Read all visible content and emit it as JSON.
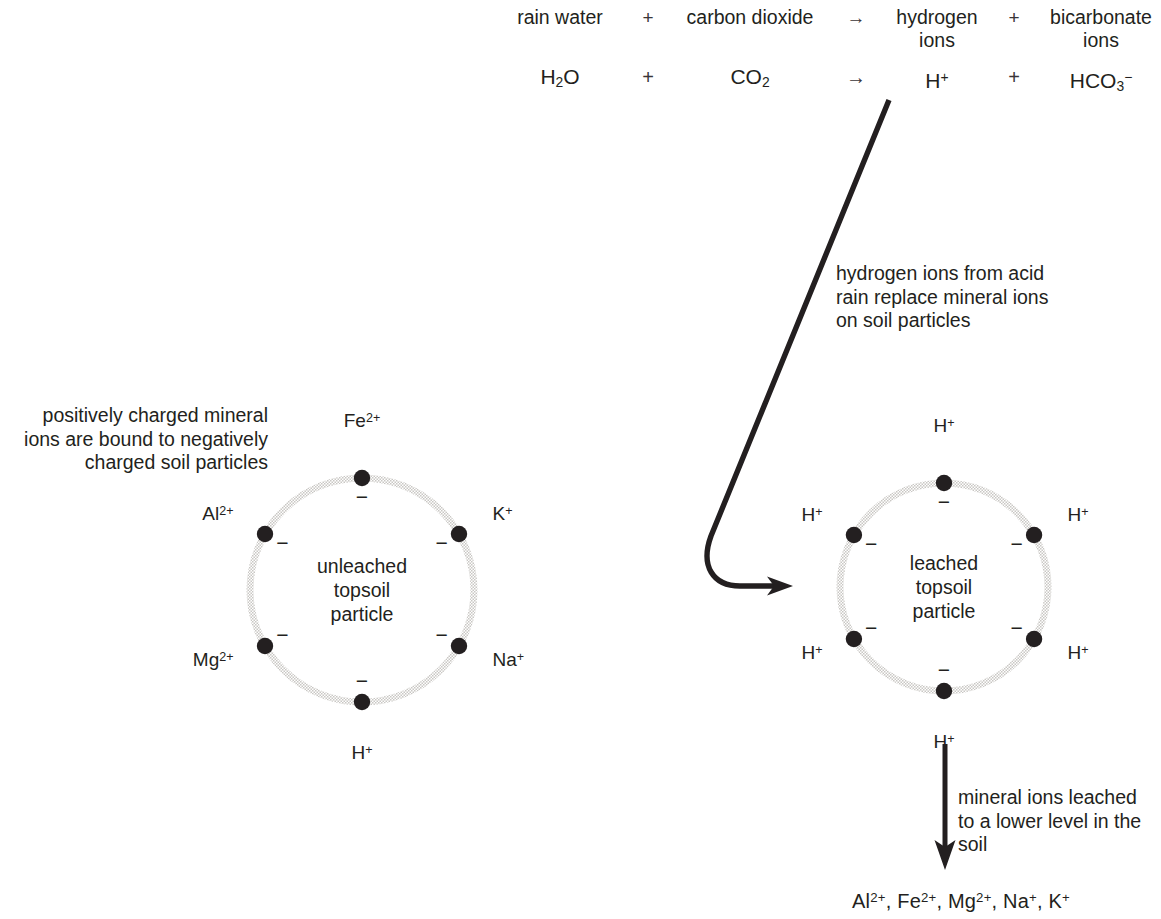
{
  "equation": {
    "word_row": {
      "reactant_1": "rain water",
      "operator_1": "+",
      "reactant_2": "carbon dioxide",
      "arrow": "→",
      "product_1": "hydrogen ions",
      "operator_2": "+",
      "product_2": "bicarbonate ions"
    },
    "symbol_row": {
      "reactant_1_formula": "H",
      "reactant_1_sub": "2",
      "reactant_1_tail": "O",
      "operator_1": "+",
      "reactant_2_formula": "CO",
      "reactant_2_sub": "2",
      "arrow": "→",
      "product_1_formula": "H",
      "product_1_sup": "+",
      "operator_2": "+",
      "product_2_formula": "HCO",
      "product_2_sub": "3",
      "product_2_sup": "−"
    }
  },
  "captions": {
    "left": "positively charged mineral ions are bound to negatively charged soil particles",
    "middle": "hydrogen ions from acid rain replace mineral ions on soil particles",
    "bottom": "mineral ions leached to a lower level in the soil"
  },
  "leached_ions": {
    "items": [
      {
        "element": "Al",
        "charge": "2+"
      },
      {
        "element": "Fe",
        "charge": "2+"
      },
      {
        "element": "Mg",
        "charge": "2+"
      },
      {
        "element": "Na",
        "charge": "+"
      },
      {
        "element": "K",
        "charge": "+"
      }
    ],
    "separator": ", "
  },
  "particles": [
    {
      "id": "unleached",
      "center_label_lines": [
        "unleached",
        "topsoil",
        "particle"
      ],
      "center_x": 362,
      "center_y": 590,
      "radius": 112,
      "ring_color": "#c9c7c4",
      "site_color": "#231f20",
      "sites": [
        {
          "name": "site-top",
          "angle": -90,
          "ion": "Fe",
          "charge": "2+",
          "site_charge": "−",
          "label_pos": "top"
        },
        {
          "name": "site-upper-left",
          "angle": -150,
          "ion": "Al",
          "charge": "2+",
          "site_charge": "−",
          "label_pos": "left"
        },
        {
          "name": "site-upper-right",
          "angle": -30,
          "ion": "K",
          "charge": "+",
          "site_charge": "−",
          "label_pos": "right"
        },
        {
          "name": "site-lower-left",
          "angle": 150,
          "ion": "Mg",
          "charge": "2+",
          "site_charge": "−",
          "label_pos": "left"
        },
        {
          "name": "site-lower-right",
          "angle": 30,
          "ion": "Na",
          "charge": "+",
          "site_charge": "−",
          "label_pos": "right"
        },
        {
          "name": "site-bottom",
          "angle": 90,
          "ion": "H",
          "charge": "+",
          "site_charge": "−",
          "label_pos": "bottom"
        }
      ]
    },
    {
      "id": "leached",
      "center_label_lines": [
        "leached",
        "topsoil",
        "particle"
      ],
      "center_x": 944,
      "center_y": 587,
      "radius": 104,
      "ring_color": "#c9c7c4",
      "site_color": "#231f20",
      "sites": [
        {
          "name": "site-top",
          "angle": -90,
          "ion": "H",
          "charge": "+",
          "site_charge": "−",
          "label_pos": "top"
        },
        {
          "name": "site-upper-left",
          "angle": -150,
          "ion": "H",
          "charge": "+",
          "site_charge": "−",
          "label_pos": "left"
        },
        {
          "name": "site-upper-right",
          "angle": -30,
          "ion": "H",
          "charge": "+",
          "site_charge": "−",
          "label_pos": "right"
        },
        {
          "name": "site-lower-left",
          "angle": 150,
          "ion": "H",
          "charge": "+",
          "site_charge": "−",
          "label_pos": "left"
        },
        {
          "name": "site-lower-right",
          "angle": 30,
          "ion": "H",
          "charge": "+",
          "site_charge": "−",
          "label_pos": "right"
        },
        {
          "name": "site-bottom",
          "angle": 90,
          "ion": "H",
          "charge": "+",
          "site_charge": "−",
          "label_pos": "bottom"
        }
      ]
    }
  ],
  "arrows": {
    "hook": {
      "name": "hydrogen-transfer-arrow",
      "color": "#231f20",
      "path": "M 889 100 L 711 536 C 700 566 713 586 740 586 L 778 586",
      "tip_x": 793,
      "tip_y": 586
    },
    "leaching": {
      "name": "leaching-arrow",
      "color": "#231f20",
      "x": 945,
      "y_start": 744,
      "y_end": 856
    }
  },
  "colors": {
    "ink": "#231f20",
    "ring": "#c9c7c4",
    "background": "#ffffff"
  }
}
